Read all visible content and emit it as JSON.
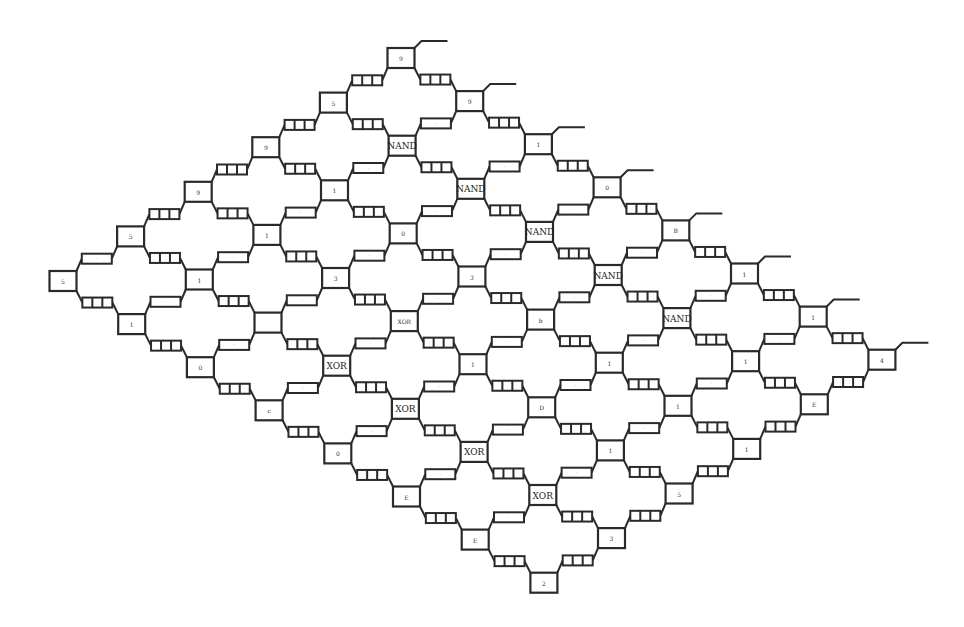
{
  "diagram": {
    "type": "systolic-array-lattice",
    "grid": {
      "cols_down_right": 8,
      "rows_down_left": 6
    },
    "origin": {
      "x": 401,
      "y": 58
    },
    "step_down_right": {
      "dx": 68.7,
      "dy": 43.1
    },
    "step_down_left": {
      "dx": -67.6,
      "dy": 44.6
    },
    "node_size": {
      "w": 27,
      "h": 20
    },
    "colors": {
      "stroke": "#2a2a2a",
      "background": "#ffffff"
    },
    "gates": {
      "nand": {
        "label": "NAND",
        "cells": [
          [
            1,
            1
          ],
          [
            2,
            1
          ],
          [
            3,
            1
          ],
          [
            4,
            1
          ],
          [
            5,
            1
          ]
        ]
      },
      "xor": {
        "label": "XOR",
        "cells": [
          [
            3,
            4
          ],
          [
            4,
            4
          ],
          [
            5,
            4
          ],
          [
            6,
            4
          ]
        ]
      }
    },
    "node_labels": [
      [
        "9",
        "5",
        "9",
        "9",
        "5",
        "5"
      ],
      [
        "9",
        "NAND",
        "1",
        "1",
        "1",
        "1"
      ],
      [
        "1",
        "NAND",
        "0",
        "3",
        "",
        "0"
      ],
      [
        "0",
        "NAND",
        "3",
        "XOR",
        "7",
        "c"
      ],
      [
        "B",
        "NAND",
        "b",
        "1",
        "XOR",
        "0"
      ],
      [
        "1",
        "NAND",
        "1",
        "D",
        "XOR",
        "E"
      ],
      [
        "1",
        "1",
        "1",
        "1",
        "XOR",
        "E"
      ],
      [
        "4",
        "E",
        "1",
        "5",
        "3",
        "2"
      ]
    ],
    "output_lines_on_row": 0,
    "connectors": {
      "down_right": "register",
      "down_left_default": "label",
      "down_left_register_columns": [
        7
      ],
      "down_left_register_col0_max_row": 3
    }
  }
}
